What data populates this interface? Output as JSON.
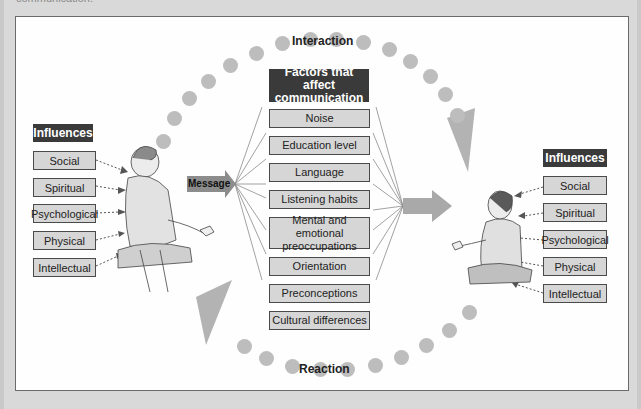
{
  "caption": "communication.",
  "diagram": {
    "top_label": "Interaction",
    "bottom_label": "Reaction",
    "factors_title": "Factors that affect communication",
    "factors": [
      "Noise",
      "Education level",
      "Language",
      "Listening habits",
      "Mental and emotional preoccupations",
      "Orientation",
      "Preconceptions",
      "Cultural differences"
    ],
    "message_label": "Message",
    "left_influences": {
      "title": "Influences",
      "items": [
        "Social",
        "Spiritual",
        "Psychological",
        "Physical",
        "Intellectual"
      ]
    },
    "right_influences": {
      "title": "Influences",
      "items": [
        "Social",
        "Spiritual",
        "Psychological",
        "Physical",
        "Intellectual"
      ]
    },
    "colors": {
      "dark_label": "#3a3a3a",
      "box_fill": "#d6d6d6",
      "dot": "#bdbdbd",
      "arrow": "#a9a9a9",
      "message_arrow": "#8c8c8c"
    }
  }
}
